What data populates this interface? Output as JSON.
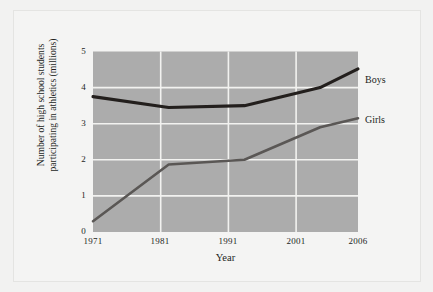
{
  "chart_data": {
    "type": "line",
    "title": "",
    "xlabel": "Year",
    "ylabel": "Number of high school students participating in athletics (millions)",
    "x": [
      1971,
      1981,
      1991,
      2001,
      2006
    ],
    "xtick_labels": [
      "1971",
      "1981",
      "1991",
      "2001",
      "2006"
    ],
    "ytick_labels": [
      "0",
      "1",
      "2",
      "3",
      "4",
      "5"
    ],
    "yticks": [
      0,
      1,
      2,
      3,
      4,
      5
    ],
    "ylim": [
      0,
      5
    ],
    "xlim": [
      1971,
      2006
    ],
    "grid": true,
    "legend_position": "right-of-plot",
    "series": [
      {
        "name": "Boys",
        "label": "Boys",
        "color": "#231f1d",
        "values": [
          3.75,
          3.45,
          3.5,
          4.0,
          4.52
        ]
      },
      {
        "name": "Girls",
        "label": "Girls",
        "color": "#5a5755",
        "values": [
          0.3,
          1.87,
          2.0,
          2.9,
          3.15
        ]
      }
    ]
  },
  "axes": {
    "x_title": "Year",
    "y_title_line1": "Number of high school students",
    "y_title_line2": "participating in athletics (millions)"
  },
  "colors": {
    "figure_background": "#f4f4f3",
    "plot_background": "#acacac",
    "gridline": "#f2f2f0",
    "boys_line": "#231f1d",
    "girls_line": "#5a5755",
    "text": "#231f1d",
    "border": "#e4e4e2"
  }
}
